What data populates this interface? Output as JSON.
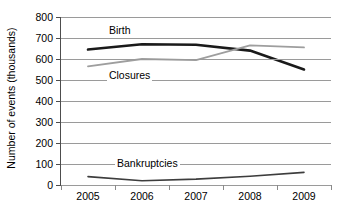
{
  "chart_data": {
    "type": "line",
    "title": "",
    "xlabel": "",
    "ylabel": "Number of events (thousands)",
    "categories": [
      "2005",
      "2006",
      "2007",
      "2008",
      "2009"
    ],
    "x_tick_labels": [
      "2005",
      "2006",
      "2007",
      "2008",
      "2009"
    ],
    "y_tick_labels": [
      "800",
      "700",
      "600",
      "500",
      "400",
      "300",
      "200",
      "100",
      "0"
    ],
    "y_tick_values": [
      800,
      700,
      600,
      500,
      400,
      300,
      200,
      100,
      0
    ],
    "ylim": [
      0,
      800
    ],
    "grid": "horizontal",
    "legend_position": "inline-annotations",
    "series": [
      {
        "name": "Birth",
        "label": "Birth",
        "color": "#1a1a1a",
        "line_width": 2.6,
        "values": [
          645,
          670,
          668,
          640,
          550
        ]
      },
      {
        "name": "Closures",
        "label": "Closures",
        "color": "#9e9e9e",
        "line_width": 1.8,
        "values": [
          565,
          600,
          595,
          665,
          655
        ]
      },
      {
        "name": "Bankruptcies",
        "label": "Bankruptcies",
        "color": "#3d3d3d",
        "line_width": 1.6,
        "values": [
          40,
          20,
          28,
          42,
          60
        ]
      }
    ],
    "annotations": [
      {
        "text": "Birth",
        "series": "Birth",
        "x": 2005.35,
        "y": 735
      },
      {
        "text": "Closures",
        "series": "Closures",
        "x": 2005.35,
        "y": 520
      },
      {
        "text": "Bankruptcies",
        "series": "Bankruptcies",
        "x": 2005.5,
        "y": 100
      }
    ]
  }
}
